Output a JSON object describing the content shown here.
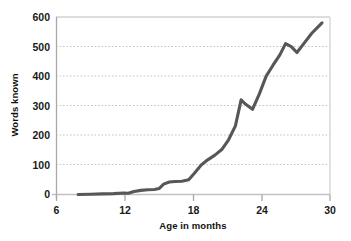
{
  "chart_data": {
    "type": "line",
    "title": "",
    "subtitle": "",
    "xlabel": "Age in months",
    "ylabel": "Words known",
    "xlim": [
      6,
      30
    ],
    "ylim": [
      0,
      600
    ],
    "xticks": [
      "6",
      "12",
      "18",
      "24",
      "30"
    ],
    "yticks": [
      "0",
      "100",
      "200",
      "300",
      "400",
      "500",
      "600"
    ],
    "grid": "horizontal-dotted",
    "legend": "none",
    "line_color": "#575757",
    "axis_color": "#bdbdbd",
    "grid_color": "#c9c9c9",
    "series": [
      {
        "name": "Words known",
        "x": [
          7.9,
          9.0,
          10.0,
          11.0,
          11.9,
          12.3,
          12.8,
          13.4,
          14.0,
          14.6,
          15.0,
          15.4,
          15.9,
          16.4,
          17.0,
          17.6,
          18.1,
          18.7,
          19.3,
          19.9,
          20.5,
          21.1,
          21.7,
          22.2,
          22.6,
          23.2,
          23.8,
          24.4,
          25.0,
          25.6,
          26.1,
          26.6,
          27.1,
          27.7,
          28.4,
          29.3
        ],
        "y": [
          0,
          1,
          2,
          3,
          5,
          4,
          10,
          14,
          16,
          17,
          20,
          35,
          42,
          44,
          45,
          50,
          72,
          100,
          118,
          133,
          152,
          185,
          232,
          320,
          305,
          288,
          340,
          400,
          437,
          472,
          510,
          500,
          480,
          510,
          545,
          580
        ]
      }
    ]
  },
  "axes": {
    "x_title": "Age in months",
    "y_title": "Words known"
  }
}
